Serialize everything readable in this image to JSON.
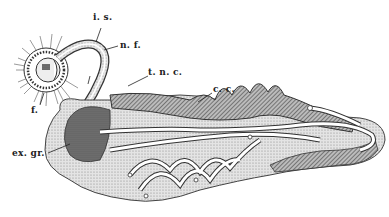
{
  "figure": {
    "type": "biological illustration (anatomical line drawing)",
    "colors": {
      "ink": "#222222",
      "background": "#ffffff",
      "stipple": "#9a9a9a",
      "dark_hatch": "#555555"
    },
    "labels": [
      {
        "id": "is",
        "text": "i. s.",
        "x": 88,
        "y": 4
      },
      {
        "id": "nf",
        "text": "n. f.",
        "x": 120,
        "y": 40
      },
      {
        "id": "tnc",
        "text": "t. n. c.",
        "x": 148,
        "y": 71
      },
      {
        "id": "cc",
        "text": "c. c.",
        "x": 213,
        "y": 88
      },
      {
        "id": "f",
        "text": "f.",
        "x": 30,
        "y": 107
      },
      {
        "id": "exgr",
        "text": "ex. gr.",
        "x": 12,
        "y": 151
      }
    ]
  }
}
